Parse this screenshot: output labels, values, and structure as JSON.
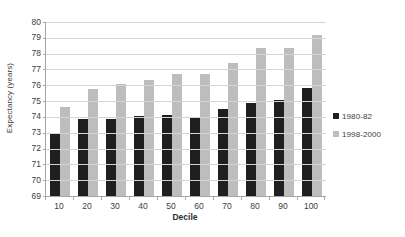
{
  "chart_data": {
    "type": "bar",
    "title": "",
    "xlabel": "Decile",
    "ylabel": "Expectancy (years)",
    "categories": [
      "10",
      "20",
      "30",
      "40",
      "50",
      "60",
      "70",
      "80",
      "90",
      "100"
    ],
    "series": [
      {
        "name": "1980-82",
        "color": "#1f1f1f",
        "values": [
          73.0,
          73.85,
          73.85,
          74.05,
          74.15,
          73.95,
          74.5,
          74.85,
          75.1,
          75.8
        ]
      },
      {
        "name": "1998-2000",
        "color": "#bdbdbd",
        "values": [
          74.65,
          75.75,
          76.05,
          76.35,
          76.7,
          76.7,
          77.4,
          78.35,
          78.35,
          79.2
        ]
      }
    ],
    "ylim": [
      69,
      80
    ],
    "yticks": [
      "69",
      "70",
      "71",
      "72",
      "73",
      "74",
      "75",
      "76",
      "77",
      "78",
      "79",
      "80"
    ],
    "grid": true,
    "legend_position": "right"
  }
}
